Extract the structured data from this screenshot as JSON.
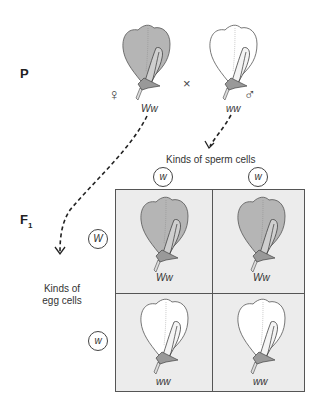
{
  "generations": {
    "parental_label": "P",
    "f1_label": "F",
    "f1_subscript": "1"
  },
  "parents": {
    "female": {
      "symbol": "♀",
      "genotype": "Ww",
      "flower_color": "purple"
    },
    "cross_symbol": "×",
    "male": {
      "symbol": "♂",
      "genotype": "ww",
      "flower_color": "white"
    }
  },
  "gametes": {
    "sperm_label": "Kinds of sperm cells",
    "sperm": [
      "w",
      "w"
    ],
    "egg_label_line1": "Kinds of",
    "egg_label_line2": "egg cells",
    "eggs": [
      "W",
      "w"
    ]
  },
  "punnett": {
    "cells": [
      {
        "row": 0,
        "col": 0,
        "genotype": "Ww",
        "flower_color": "purple"
      },
      {
        "row": 0,
        "col": 1,
        "genotype": "Ww",
        "flower_color": "purple"
      },
      {
        "row": 1,
        "col": 0,
        "genotype": "ww",
        "flower_color": "white"
      },
      {
        "row": 1,
        "col": 1,
        "genotype": "ww",
        "flower_color": "white"
      }
    ]
  },
  "colors": {
    "purple_petal": "#b9b9b9",
    "white_petal": "#ffffff",
    "grid_bg": "#ececec",
    "line": "#333333"
  }
}
